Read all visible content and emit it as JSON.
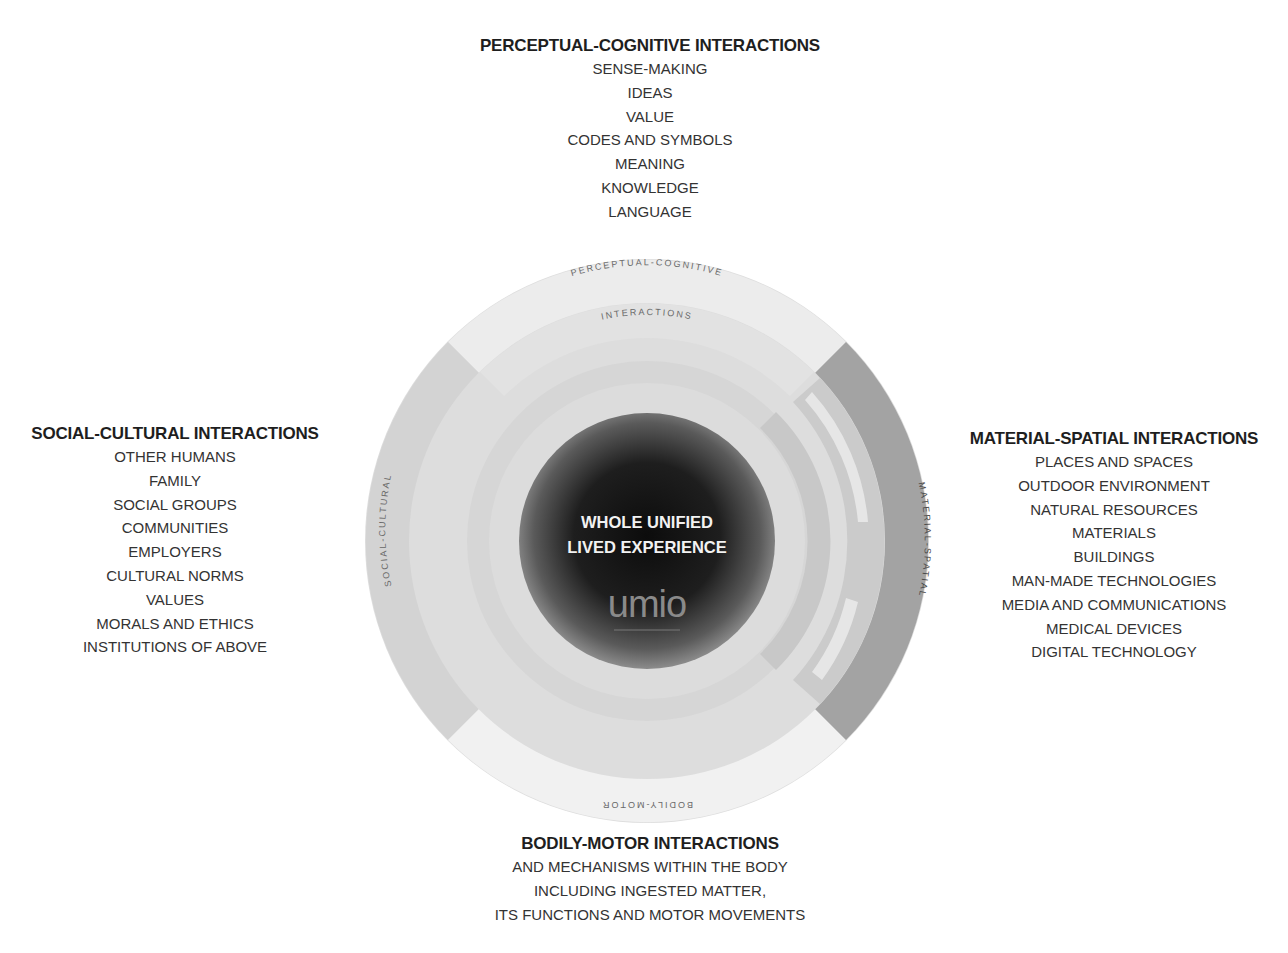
{
  "diagram": {
    "center": {
      "line1": "WHOLE UNIFIED",
      "line2": "LIVED EXPERIENCE",
      "logo_text": "umio"
    },
    "ring_labels": {
      "top_outer": "PERCEPTUAL-COGNITIVE",
      "top_inner": "INTERACTIONS",
      "left": "SOCIAL-CULTURAL",
      "right": "MATERIAL-SPATIAL",
      "bottom": "BODILY-MOTOR"
    },
    "colors": {
      "background": "#ffffff",
      "outer_top": "#ececec",
      "outer_left": "#d2d2d2",
      "outer_right": "#9e9e9e",
      "outer_bottom": "#f0f0f0",
      "mid_ring": "#dcdcdc",
      "inner_ring": "#d0d0d0",
      "core_dark": "#111111",
      "core_edge": "#7a7a7a"
    }
  },
  "perceptual_cognitive": {
    "title": "PERCEPTUAL-COGNITIVE INTERACTIONS",
    "items": [
      "SENSE-MAKING",
      "IDEAS",
      "VALUE",
      "CODES AND SYMBOLS",
      "MEANING",
      "KNOWLEDGE",
      "LANGUAGE"
    ]
  },
  "social_cultural": {
    "title": "SOCIAL-CULTURAL INTERACTIONS",
    "items": [
      "OTHER HUMANS",
      "FAMILY",
      "SOCIAL GROUPS",
      "COMMUNITIES",
      "EMPLOYERS",
      "CULTURAL NORMS",
      "VALUES",
      "MORALS AND ETHICS",
      "INSTITUTIONS OF ABOVE"
    ]
  },
  "material_spatial": {
    "title": "MATERIAL-SPATIAL INTERACTIONS",
    "items": [
      "PLACES AND SPACES",
      "OUTDOOR ENVIRONMENT",
      "NATURAL RESOURCES",
      "MATERIALS",
      "BUILDINGS",
      "MAN-MADE TECHNOLOGIES",
      "MEDIA AND COMMUNICATIONS",
      "MEDICAL DEVICES",
      "DIGITAL TECHNOLOGY"
    ]
  },
  "bodily_motor": {
    "title": "BODILY-MOTOR INTERACTIONS",
    "items": [
      "AND MECHANISMS WITHIN THE BODY",
      "INCLUDING INGESTED MATTER,",
      "ITS FUNCTIONS AND MOTOR MOVEMENTS"
    ]
  }
}
